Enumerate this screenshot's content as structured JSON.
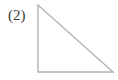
{
  "figure": {
    "label": "(2)",
    "background_color": "#ffffff",
    "label_color": "#3a3a3a",
    "stroke_color": "#b3b3b3",
    "stroke_width": 1.4,
    "shape": {
      "name": "right-triangle",
      "right_angle_at": "bottom-left",
      "vertices": [
        {
          "name": "apex-top-left",
          "x": 38,
          "y": 5
        },
        {
          "name": "right-angle-bottom-left",
          "x": 38,
          "y": 72
        },
        {
          "name": "bottom-right",
          "x": 113,
          "y": 72
        }
      ],
      "points_attr": "38,5 38,72 113,72",
      "edges": [
        {
          "name": "vertical-leg",
          "from": "apex-top-left",
          "to": "right-angle-bottom-left"
        },
        {
          "name": "horizontal-leg",
          "from": "right-angle-bottom-left",
          "to": "bottom-right"
        },
        {
          "name": "hypotenuse",
          "from": "apex-top-left",
          "to": "bottom-right"
        }
      ]
    }
  }
}
